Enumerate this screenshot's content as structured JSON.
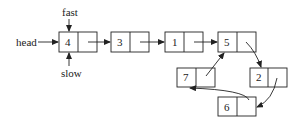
{
  "diagram": {
    "labels": {
      "head": "head",
      "fast": "fast",
      "slow": "slow"
    },
    "nodes": [
      {
        "id": "n4",
        "value": "4",
        "x": 59,
        "y": 32
      },
      {
        "id": "n3",
        "value": "3",
        "x": 111,
        "y": 32
      },
      {
        "id": "n1",
        "value": "1",
        "x": 165,
        "y": 32
      },
      {
        "id": "n5",
        "value": "5",
        "x": 218,
        "y": 32
      },
      {
        "id": "n2",
        "value": "2",
        "x": 250,
        "y": 68
      },
      {
        "id": "n6",
        "value": "6",
        "x": 218,
        "y": 97
      },
      {
        "id": "n7",
        "value": "7",
        "x": 177,
        "y": 68
      }
    ],
    "edges": [
      {
        "from": "4",
        "to": "3"
      },
      {
        "from": "3",
        "to": "1"
      },
      {
        "from": "1",
        "to": "5"
      },
      {
        "from": "5",
        "to": "2"
      },
      {
        "from": "2",
        "to": "6"
      },
      {
        "from": "6",
        "to": "7"
      },
      {
        "from": "7",
        "to": "5"
      }
    ],
    "colors": {
      "stroke": "#222222",
      "background": "#ffffff"
    }
  }
}
